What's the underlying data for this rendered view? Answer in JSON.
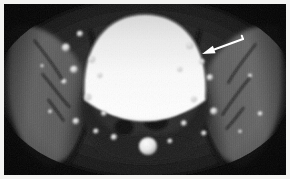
{
  "figure": {
    "kind": "medical-image",
    "modality": "MRI",
    "plane": "axial",
    "region": "pelvis",
    "caption_text": "",
    "width": 290,
    "height": 179,
    "border_color": "#f3f3f1",
    "border_width": 4,
    "background_color": "#050505"
  },
  "scan": {
    "canvas": {
      "width": 282,
      "height": 172
    },
    "grayscale": {
      "black": "#030303",
      "dark": "#141414",
      "muscle": "#4c4c4c",
      "muscle_light": "#6a6a6a",
      "fat": "#8f8f8f",
      "bright": "#d6d6d6",
      "white": "#ffffff"
    },
    "structures": [
      {
        "name": "urinary-bladder",
        "label": "Bladder (T2 hyperintense)",
        "shape": "dome",
        "cx": 140,
        "cy": 62,
        "rx": 64,
        "ry": 52,
        "fill": "#ffffff",
        "intensity": "very-bright"
      },
      {
        "name": "left-iliac-muscle",
        "label": "Left iliacus / gluteal muscle mass",
        "shape": "crescent",
        "cx": 48,
        "cy": 86,
        "rx": 46,
        "ry": 74,
        "fill": "#585858",
        "intensity": "intermediate"
      },
      {
        "name": "right-iliac-muscle",
        "label": "Right iliacus / gluteal muscle mass",
        "shape": "crescent",
        "cx": 234,
        "cy": 86,
        "rx": 46,
        "ry": 74,
        "fill": "#5d5d5d",
        "intensity": "intermediate"
      },
      {
        "name": "bowel-loop-left",
        "label": "Bowel loop (signal void)",
        "shape": "ellipse",
        "cx": 120,
        "cy": 102,
        "rx": 15,
        "ry": 13,
        "fill": "#060606",
        "intensity": "dark"
      },
      {
        "name": "bowel-loop-right",
        "label": "Bowel loop (signal void)",
        "shape": "ellipse",
        "cx": 162,
        "cy": 96,
        "rx": 14,
        "ry": 15,
        "fill": "#050505",
        "intensity": "dark"
      },
      {
        "name": "midline-nodule",
        "label": "Bright rounded midline structure",
        "shape": "circle",
        "cx": 144,
        "cy": 143,
        "rx": 9,
        "ry": 9,
        "fill": "#f2f2f2",
        "intensity": "bright"
      },
      {
        "name": "sacrum",
        "label": "Sacrum / presacral soft tissue",
        "shape": "wedge",
        "cx": 141,
        "cy": 150,
        "rx": 52,
        "ry": 28,
        "fill": "#2b2b2b",
        "intensity": "dark"
      }
    ],
    "bright_foci": [
      {
        "cx": 62,
        "cy": 44,
        "r": 4.2
      },
      {
        "cx": 76,
        "cy": 30,
        "r": 3.2
      },
      {
        "cx": 88,
        "cy": 56,
        "r": 3.4
      },
      {
        "cx": 70,
        "cy": 66,
        "r": 4.0
      },
      {
        "cx": 96,
        "cy": 72,
        "r": 2.6
      },
      {
        "cx": 60,
        "cy": 78,
        "r": 2.8
      },
      {
        "cx": 84,
        "cy": 94,
        "r": 3.6
      },
      {
        "cx": 100,
        "cy": 110,
        "r": 3.0
      },
      {
        "cx": 72,
        "cy": 118,
        "r": 3.4
      },
      {
        "cx": 92,
        "cy": 128,
        "r": 2.8
      },
      {
        "cx": 110,
        "cy": 134,
        "r": 3.2
      },
      {
        "cx": 186,
        "cy": 42,
        "r": 3.6
      },
      {
        "cx": 198,
        "cy": 58,
        "r": 3.0
      },
      {
        "cx": 176,
        "cy": 66,
        "r": 2.6
      },
      {
        "cx": 206,
        "cy": 74,
        "r": 3.4
      },
      {
        "cx": 190,
        "cy": 96,
        "r": 3.0
      },
      {
        "cx": 210,
        "cy": 108,
        "r": 3.8
      },
      {
        "cx": 180,
        "cy": 120,
        "r": 3.0
      },
      {
        "cx": 200,
        "cy": 130,
        "r": 2.8
      },
      {
        "cx": 166,
        "cy": 138,
        "r": 2.6
      },
      {
        "cx": 46,
        "cy": 108,
        "r": 1.8
      },
      {
        "cx": 38,
        "cy": 62,
        "r": 1.6
      },
      {
        "cx": 246,
        "cy": 72,
        "r": 2.0
      },
      {
        "cx": 256,
        "cy": 110,
        "r": 2.2
      },
      {
        "cx": 236,
        "cy": 128,
        "r": 1.8
      }
    ],
    "fascial_lines": [
      {
        "name": "left-fascial-plane-1",
        "x1": 30,
        "y1": 36,
        "x2": 58,
        "y2": 76
      },
      {
        "name": "left-fascial-plane-2",
        "x1": 38,
        "y1": 70,
        "x2": 66,
        "y2": 104
      },
      {
        "name": "left-fascial-plane-3",
        "x1": 44,
        "y1": 96,
        "x2": 60,
        "y2": 118
      },
      {
        "name": "right-fascial-plane-1",
        "x1": 252,
        "y1": 40,
        "x2": 224,
        "y2": 80
      },
      {
        "name": "right-fascial-plane-2",
        "x1": 246,
        "y1": 74,
        "x2": 218,
        "y2": 112
      },
      {
        "name": "right-fascial-plane-3",
        "x1": 240,
        "y1": 104,
        "x2": 222,
        "y2": 126
      }
    ]
  },
  "annotation": {
    "arrow": {
      "name": "pointer-arrow",
      "color": "#ffffff",
      "tail_x": 243,
      "tail_y": 39,
      "tip_x": 202,
      "tip_y": 54,
      "head_length": 13,
      "head_width": 8,
      "shaft_width": 2,
      "description": "White arrow indicating right pelvic sidewall finding"
    }
  }
}
